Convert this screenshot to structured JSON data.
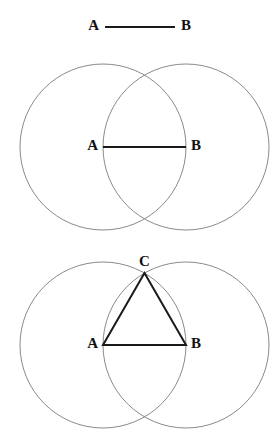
{
  "canvas": {
    "width": 279,
    "height": 441,
    "background": "#ffffff"
  },
  "style": {
    "circle_stroke": "#8a8a8a",
    "circle_stroke_width": 1,
    "segment_stroke": "#1a1a1a",
    "segment_stroke_width": 2,
    "label_color": "#111111",
    "label_font_size": 15
  },
  "figures": [
    {
      "id": "given-segment",
      "caption": "Given segment AB",
      "segment": {
        "x1": 105,
        "y1": 27,
        "x2": 175,
        "y2": 27
      },
      "labels": {
        "a": {
          "text": "A",
          "x": 99,
          "y": 27
        },
        "b": {
          "text": "B",
          "x": 181,
          "y": 27
        }
      }
    },
    {
      "id": "two-circles",
      "caption": "Circles centered at A and B with radius AB",
      "circle_a": {
        "cx": 103,
        "cy": 147,
        "r": 83
      },
      "circle_b": {
        "cx": 186,
        "cy": 147,
        "r": 83
      },
      "segment": {
        "x1": 103,
        "y1": 147,
        "x2": 186,
        "y2": 147
      },
      "labels": {
        "a": {
          "text": "A",
          "x": 98,
          "y": 147
        },
        "b": {
          "text": "B",
          "x": 191,
          "y": 147
        }
      }
    },
    {
      "id": "equilateral-triangle",
      "caption": "Equilateral triangle ABC from circle intersection",
      "circle_a": {
        "cx": 103,
        "cy": 345,
        "r": 83
      },
      "circle_b": {
        "cx": 186,
        "cy": 345,
        "r": 83
      },
      "vertex_a": {
        "x": 103,
        "y": 345
      },
      "vertex_b": {
        "x": 186,
        "y": 345
      },
      "vertex_c": {
        "x": 144.5,
        "y": 273
      },
      "triangle_points": "103,345 186,345 144.5,273",
      "labels": {
        "a": {
          "text": "A",
          "x": 98,
          "y": 345
        },
        "b": {
          "text": "B",
          "x": 191,
          "y": 345
        },
        "c": {
          "text": "C",
          "x": 144.5,
          "y": 263
        }
      }
    }
  ]
}
